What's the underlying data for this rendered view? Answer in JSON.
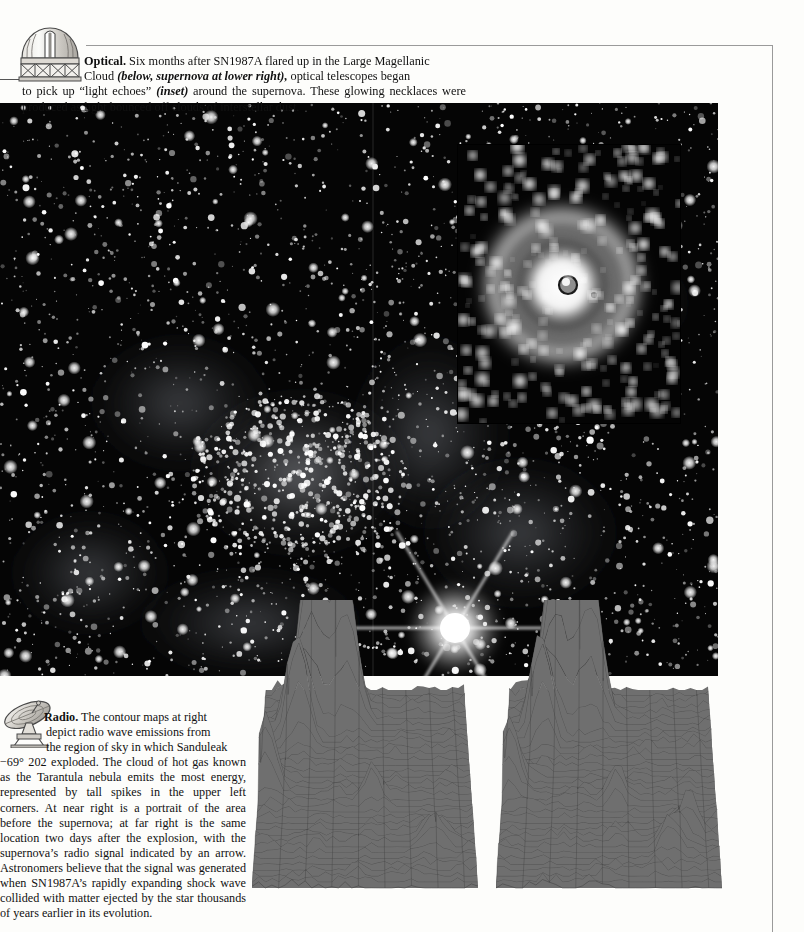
{
  "page": {
    "background_color": "#fdfdfb",
    "frame_color": "#9a9a9a"
  },
  "optical": {
    "icon": "observatory-dome-icon",
    "heading": "Optical.",
    "body_line1": " Six months after SN1987A flared up in the Large Magellanic",
    "body_line2_a": "Cloud ",
    "body_line2_italic": "(below, supernova at lower right),",
    "body_line2_b": " optical telescopes began",
    "body_line3_a": "to pick up “light echoes” ",
    "body_line3_italic": "(inset)",
    "body_line3_b": " around the supernova. These glowing necklaces",
    "body_line4": "were produced as light bounced off clouds of interstellar dust.",
    "photo_alt": "Large Magellanic Cloud star field with supernova SN1987A at lower right",
    "inset_alt": "Light echo rings around the supernova"
  },
  "radio": {
    "icon": "radio-dish-icon",
    "heading": "Radio.",
    "body_line1": " The contour maps at right",
    "body_line2": "depict radio wave emissions from",
    "body_line3": "the region of sky in which Sanduleak",
    "body_rest": "−69° 202 exploded. The cloud of hot gas known as the Tarantula nebula emits the most energy, represented by tall spikes in the upper left corners. At near right is a portrait of the area before the supernova; at far right is the same location two days after the explosion, with the supernova’s radio signal indicated by an arrow. Astronomers believe that the signal was generated when SN1987A’s rapidly expanding shock wave collided with matter ejected by the star thousands of years earlier in its evolution.",
    "left_plot_label": "before the supernova",
    "right_plot_label": "two days after the explosion"
  },
  "chart_data": [
    {
      "type": "surface",
      "title": "Radio contour map — before the supernova",
      "xlabel": "",
      "ylabel": "",
      "zlabel": "radio emission intensity",
      "grid": true,
      "legend": "none",
      "surface_color": "#6f6f6f",
      "mesh_color": "#3a3a3a",
      "xlim": [
        0,
        10
      ],
      "ylim": [
        0,
        10
      ],
      "zlim": [
        0,
        100
      ],
      "peaks": [
        {
          "name": "tarantula-main-spike",
          "x": 2.4,
          "y": 9.3,
          "z": 100
        },
        {
          "name": "tarantula-second-spike",
          "x": 3.9,
          "y": 9.0,
          "z": 72
        },
        {
          "name": "ridge-peak-a",
          "x": 1.4,
          "y": 8.0,
          "z": 34
        },
        {
          "name": "ridge-peak-b",
          "x": 1.9,
          "y": 7.6,
          "z": 30
        },
        {
          "name": "left-edge-spike",
          "x": 0.3,
          "y": 5.2,
          "z": 40
        },
        {
          "name": "small-bump",
          "x": 4.5,
          "y": 8.7,
          "z": 18
        },
        {
          "name": "mid-peak",
          "x": 5.3,
          "y": 4.6,
          "z": 16
        },
        {
          "name": "low-peak-a",
          "x": 7.9,
          "y": 2.3,
          "z": 12
        },
        {
          "name": "low-peak-b",
          "x": 8.6,
          "y": 2.3,
          "z": 12
        }
      ]
    },
    {
      "type": "surface",
      "title": "Radio contour map — two days after the explosion",
      "xlabel": "",
      "ylabel": "",
      "zlabel": "radio emission intensity",
      "grid": true,
      "legend": "none",
      "surface_color": "#6f6f6f",
      "mesh_color": "#3a3a3a",
      "xlim": [
        0,
        10
      ],
      "ylim": [
        0,
        10
      ],
      "zlim": [
        0,
        100
      ],
      "peaks": [
        {
          "name": "tarantula-main-spike",
          "x": 2.4,
          "y": 9.3,
          "z": 100
        },
        {
          "name": "tarantula-second-spike",
          "x": 3.9,
          "y": 9.0,
          "z": 76
        },
        {
          "name": "ridge-peak-a",
          "x": 1.4,
          "y": 8.0,
          "z": 34
        },
        {
          "name": "ridge-peak-b",
          "x": 1.9,
          "y": 7.6,
          "z": 30
        },
        {
          "name": "left-edge-spike",
          "x": 0.3,
          "y": 5.2,
          "z": 40
        },
        {
          "name": "small-bump",
          "x": 4.5,
          "y": 8.7,
          "z": 18
        },
        {
          "name": "mid-peak",
          "x": 5.3,
          "y": 4.6,
          "z": 17
        },
        {
          "name": "supernova-signal-peak",
          "x": 8.7,
          "y": 2.9,
          "z": 20
        },
        {
          "name": "low-peak-a",
          "x": 7.6,
          "y": 2.0,
          "z": 14
        },
        {
          "name": "low-peak-b",
          "x": 8.2,
          "y": 2.2,
          "z": 12
        }
      ]
    }
  ]
}
